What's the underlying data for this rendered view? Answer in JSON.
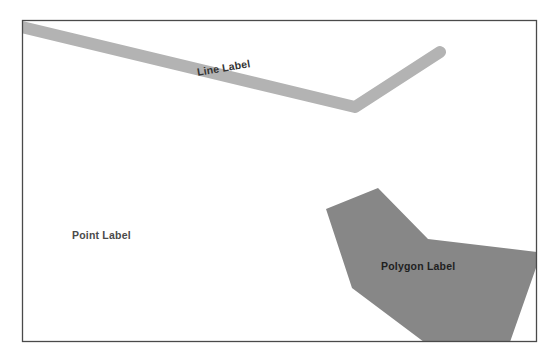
{
  "figure": {
    "title": "",
    "frame": {
      "x": 22,
      "y": 20,
      "width": 515,
      "height": 322,
      "border_color": "#4a4a4a",
      "background_color": "#ffffff"
    }
  },
  "labels": {
    "line": "Line Label",
    "point": "Point Label",
    "polygon": "Polygon Label"
  },
  "features": {
    "line": {
      "name": "line-feature",
      "color": "#b3b3b3",
      "stroke_width": 12,
      "cap": "round",
      "points": "22,27 355,107 440,52"
    },
    "polygon": {
      "name": "polygon-feature",
      "color": "#878787",
      "points": "378,188 326,209 352,288 424,342 510,342 537,265 537,252 428,239"
    }
  },
  "colors": {
    "line_gray": "#b3b3b3",
    "polygon_gray": "#878787",
    "frame_border": "#4a4a4a",
    "label_text": "#2b2b2b",
    "canvas_background": "#ffffff"
  }
}
